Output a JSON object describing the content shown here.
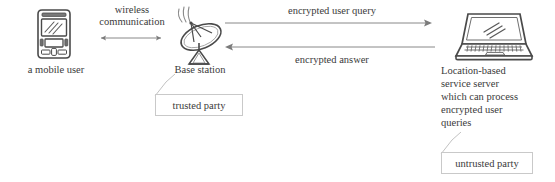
{
  "diagram": {
    "nodes": {
      "mobile": {
        "icon": "mobile-phone-icon",
        "label": "a mobile user"
      },
      "base_station": {
        "icon": "satellite-dish-icon",
        "label": "Base station",
        "callout": "trusted party"
      },
      "server": {
        "icon": "laptop-icon",
        "label_lines": [
          "Location-based",
          "service server",
          "which can process",
          "encrypted user",
          "queries"
        ],
        "callout": "untrusted party"
      }
    },
    "edges": {
      "wireless": {
        "label_lines": [
          "wireless",
          "communication"
        ],
        "direction": "bidirectional"
      },
      "query": {
        "label": "encrypted user query",
        "direction": "right"
      },
      "answer": {
        "label": "encrypted answer",
        "direction": "left"
      }
    },
    "colors": {
      "stroke": "#5a5a5a",
      "text": "#3a3a3a",
      "box_border": "#c9c9c9",
      "background": "#ffffff"
    }
  }
}
